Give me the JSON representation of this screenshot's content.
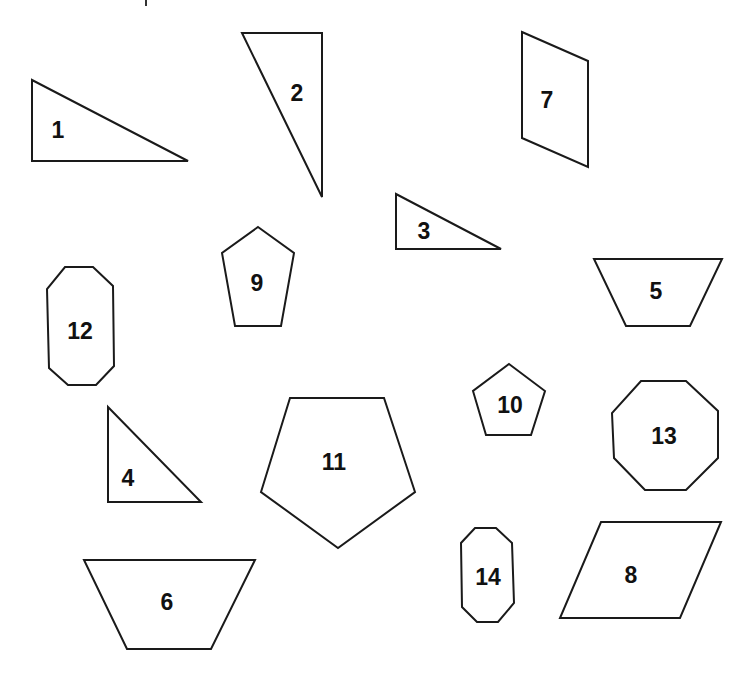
{
  "canvas": {
    "width": 751,
    "height": 681,
    "background": "#ffffff",
    "stroke_color": "#1a1a1a"
  },
  "shapes": [
    {
      "id": "1",
      "type": "right-triangle",
      "label": "1",
      "points": [
        [
          32,
          80
        ],
        [
          188,
          161
        ],
        [
          32,
          161
        ]
      ],
      "label_pos": [
        58,
        130
      ]
    },
    {
      "id": "2",
      "type": "right-triangle",
      "label": "2",
      "points": [
        [
          242,
          33
        ],
        [
          322,
          33
        ],
        [
          322,
          197
        ]
      ],
      "label_pos": [
        297,
        93
      ]
    },
    {
      "id": "3",
      "type": "right-triangle",
      "label": "3",
      "points": [
        [
          396,
          194
        ],
        [
          501,
          249
        ],
        [
          396,
          249
        ]
      ],
      "label_pos": [
        424,
        231
      ]
    },
    {
      "id": "4",
      "type": "right-triangle",
      "label": "4",
      "points": [
        [
          108,
          407
        ],
        [
          201,
          502
        ],
        [
          108,
          502
        ]
      ],
      "label_pos": [
        128,
        478
      ]
    },
    {
      "id": "5",
      "type": "trapezoid",
      "label": "5",
      "points": [
        [
          594,
          259
        ],
        [
          722,
          259
        ],
        [
          690,
          326
        ],
        [
          626,
          326
        ]
      ],
      "label_pos": [
        656,
        291
      ]
    },
    {
      "id": "6",
      "type": "trapezoid",
      "label": "6",
      "points": [
        [
          84,
          560
        ],
        [
          255,
          560
        ],
        [
          211,
          649
        ],
        [
          127,
          649
        ]
      ],
      "label_pos": [
        167,
        602
      ]
    },
    {
      "id": "7",
      "type": "parallelogram",
      "label": "7",
      "points": [
        [
          522,
          32
        ],
        [
          588,
          61
        ],
        [
          588,
          167
        ],
        [
          522,
          138
        ]
      ],
      "label_pos": [
        547,
        100
      ]
    },
    {
      "id": "8",
      "type": "parallelogram",
      "label": "8",
      "points": [
        [
          601,
          522
        ],
        [
          721,
          522
        ],
        [
          680,
          618
        ],
        [
          560,
          618
        ]
      ],
      "label_pos": [
        631,
        575
      ]
    },
    {
      "id": "9",
      "type": "pentagon",
      "label": "9",
      "points": [
        [
          258,
          227
        ],
        [
          294,
          253
        ],
        [
          281,
          326
        ],
        [
          235,
          326
        ],
        [
          222,
          253
        ]
      ],
      "label_pos": [
        257,
        283
      ]
    },
    {
      "id": "10",
      "type": "pentagon",
      "label": "10",
      "points": [
        [
          509,
          364
        ],
        [
          545,
          391
        ],
        [
          531,
          435
        ],
        [
          486,
          435
        ],
        [
          473,
          391
        ]
      ],
      "label_pos": [
        510,
        405
      ]
    },
    {
      "id": "11",
      "type": "pentagon",
      "label": "11",
      "points": [
        [
          290,
          398
        ],
        [
          384,
          398
        ],
        [
          415,
          492
        ],
        [
          338,
          548
        ],
        [
          261,
          492
        ]
      ],
      "label_pos": [
        334,
        462
      ]
    },
    {
      "id": "12",
      "type": "octagon",
      "label": "12",
      "points": [
        [
          65,
          267
        ],
        [
          93,
          267
        ],
        [
          113,
          286
        ],
        [
          114,
          366
        ],
        [
          96,
          385
        ],
        [
          68,
          385
        ],
        [
          49,
          368
        ],
        [
          47,
          289
        ]
      ],
      "label_pos": [
        80,
        331
      ]
    },
    {
      "id": "13",
      "type": "octagon",
      "label": "13",
      "points": [
        [
          641,
          381
        ],
        [
          686,
          381
        ],
        [
          718,
          411
        ],
        [
          718,
          458
        ],
        [
          686,
          490
        ],
        [
          645,
          490
        ],
        [
          614,
          458
        ],
        [
          612,
          413
        ]
      ],
      "label_pos": [
        664,
        436
      ]
    },
    {
      "id": "14",
      "type": "octagon",
      "label": "14",
      "points": [
        [
          475,
          528
        ],
        [
          496,
          528
        ],
        [
          512,
          543
        ],
        [
          514,
          603
        ],
        [
          498,
          622
        ],
        [
          477,
          622
        ],
        [
          462,
          607
        ],
        [
          461,
          543
        ]
      ],
      "label_pos": [
        488,
        577
      ]
    }
  ]
}
